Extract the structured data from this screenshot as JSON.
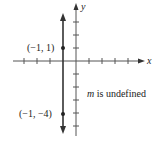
{
  "axes": {
    "x_label": "x",
    "y_label": "y",
    "x_ticks": [
      -4,
      -3,
      -2,
      -1,
      1,
      2,
      3,
      4
    ],
    "y_ticks": [
      4,
      3,
      2,
      1,
      -1,
      -2,
      -3,
      -4,
      -5
    ]
  },
  "line": {
    "equation": "x = -1",
    "x_value": -1,
    "color": "#333333"
  },
  "points": [
    {
      "label": "(−1, 1)",
      "x": -1,
      "y": 1
    },
    {
      "label": "(−1, −4)",
      "x": -1,
      "y": -4
    }
  ],
  "annotation": {
    "slope_symbol": "m",
    "slope_text": " is undefined"
  }
}
